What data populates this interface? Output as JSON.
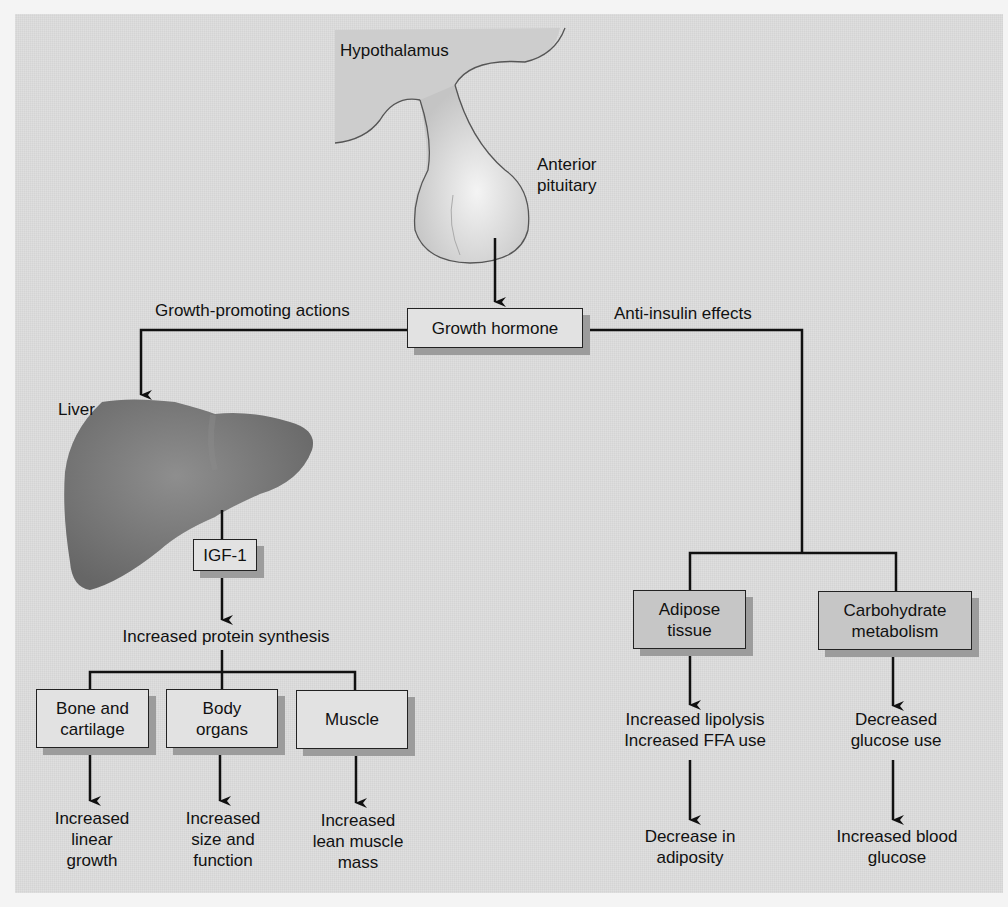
{
  "diagram": {
    "organs": {
      "hypothalamus": "Hypothalamus",
      "anterior_pituitary": [
        "Anterior",
        "pituitary"
      ],
      "liver": "Liver"
    },
    "hormone": "Growth hormone",
    "branches": {
      "left": "Growth-promoting actions",
      "right": "Anti-insulin effects"
    },
    "igf": "IGF-1",
    "protein_synthesis": "Increased protein synthesis",
    "targets_left": [
      {
        "box": [
          "Bone and",
          "cartilage"
        ],
        "effect": [
          "Increased",
          "linear",
          "growth"
        ]
      },
      {
        "box": [
          "Body",
          "organs"
        ],
        "effect": [
          "Increased",
          "size and",
          "function"
        ]
      },
      {
        "box": [
          "Muscle"
        ],
        "effect": [
          "Increased",
          "lean muscle",
          "mass"
        ]
      }
    ],
    "targets_right": [
      {
        "box": [
          "Adipose",
          "tissue"
        ],
        "effect1": [
          "Increased lipolysis",
          "Increased FFA use"
        ],
        "effect2": [
          "Decrease in",
          "adiposity"
        ]
      },
      {
        "box": [
          "Carbohydrate",
          "metabolism"
        ],
        "effect1": [
          "Decreased",
          "glucose use"
        ],
        "effect2": [
          "Increased blood",
          "glucose"
        ]
      }
    ],
    "colors": {
      "background": "#dcdcdc",
      "liver": "#7a7a7a",
      "pituitary": "#e6e6e6",
      "box_light": "#e2e2e2",
      "box_dark": "#c6c6c6",
      "shadow": "#9c9c9c",
      "line": "#111111"
    }
  }
}
